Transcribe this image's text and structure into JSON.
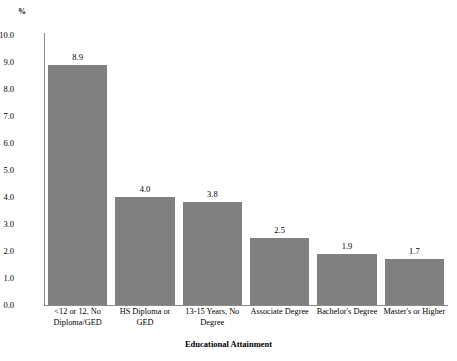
{
  "chart_data": {
    "type": "bar",
    "title": "",
    "subtitle": "",
    "xlabel": "Educational Attainment",
    "ylabel": "%",
    "ylim": [
      0.0,
      10.0
    ],
    "ytick_step": 1.0,
    "grid": false,
    "legend": "none",
    "bar_color": "#808080",
    "axis_color": "#8a8a8a",
    "categories": [
      "<12 or 12, No Diploma/GED",
      "HS Diploma or GED",
      "13-15 Years, No Degree",
      "Associate Degree",
      "Bachelor's Degree",
      "Master's or Higher"
    ],
    "values": [
      8.9,
      4.0,
      3.8,
      2.5,
      1.9,
      1.7
    ],
    "value_labels": [
      "8.9",
      "4.0",
      "3.8",
      "2.5",
      "1.9",
      "1.7"
    ],
    "ytick_labels": [
      "10.0",
      "9.0",
      "8.0",
      "7.0",
      "6.0",
      "5.0",
      "4.0",
      "3.0",
      "2.0",
      "1.0",
      "0.0"
    ],
    "ytick_values": [
      10.0,
      9.0,
      8.0,
      7.0,
      6.0,
      5.0,
      4.0,
      3.0,
      2.0,
      1.0,
      0.0
    ]
  }
}
